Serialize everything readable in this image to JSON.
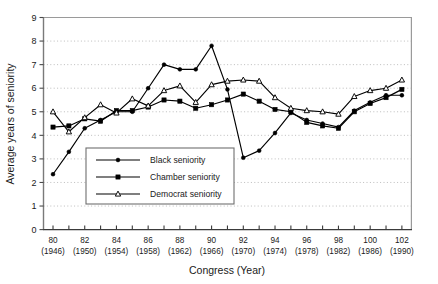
{
  "chart_data": {
    "type": "line",
    "title": "",
    "xlabel": "Congress (Year)",
    "ylabel": "Average years of seniority",
    "xlim": [
      79.4,
      102.6
    ],
    "ylim": [
      0,
      9
    ],
    "ytick_values": [
      0,
      1,
      2,
      3,
      4,
      5,
      6,
      7,
      8,
      9
    ],
    "ytick_labels": [
      "0",
      "1",
      "2",
      "3",
      "4",
      "5",
      "6",
      "7",
      "8",
      "9"
    ],
    "grid": "horizontal-dotted",
    "legend_position": "lower-left-inside",
    "x": [
      80,
      81,
      82,
      83,
      84,
      85,
      86,
      87,
      88,
      89,
      90,
      91,
      92,
      93,
      94,
      95,
      96,
      97,
      98,
      99,
      100,
      101,
      102
    ],
    "xtick_labels": [
      {
        "congress": "80",
        "year": "(1946)"
      },
      {
        "congress": "82",
        "year": "(1950)"
      },
      {
        "congress": "84",
        "year": "(1954)"
      },
      {
        "congress": "86",
        "year": "(1958)"
      },
      {
        "congress": "88",
        "year": "(1962)"
      },
      {
        "congress": "90",
        "year": "(1966)"
      },
      {
        "congress": "92",
        "year": "(1970)"
      },
      {
        "congress": "94",
        "year": "(1974)"
      },
      {
        "congress": "96",
        "year": "(1978)"
      },
      {
        "congress": "98",
        "year": "(1982)"
      },
      {
        "congress": "100",
        "year": "(1986)"
      },
      {
        "congress": "102",
        "year": "(1990)"
      }
    ],
    "series": [
      {
        "name": "Black seniority",
        "marker": "dot",
        "values": [
          2.35,
          3.3,
          4.3,
          4.65,
          5.0,
          5.0,
          6.0,
          7.0,
          6.8,
          6.8,
          7.8,
          5.95,
          3.05,
          3.35,
          4.1,
          4.95,
          4.65,
          4.5,
          4.35,
          5.05,
          5.4,
          5.7,
          5.7
        ]
      },
      {
        "name": "Chamber seniority",
        "marker": "square",
        "values": [
          4.35,
          4.4,
          4.7,
          4.6,
          5.05,
          5.05,
          5.2,
          5.5,
          5.45,
          5.15,
          5.3,
          5.5,
          5.75,
          5.45,
          5.1,
          5.0,
          4.55,
          4.4,
          4.3,
          5.0,
          5.35,
          5.6,
          5.95
        ]
      },
      {
        "name": "Democrat seniority",
        "marker": "triangle",
        "values": [
          5.0,
          4.15,
          4.75,
          5.3,
          4.95,
          5.55,
          5.25,
          5.9,
          6.1,
          5.4,
          6.15,
          6.3,
          6.35,
          6.3,
          5.6,
          5.15,
          5.05,
          5.0,
          4.9,
          5.65,
          5.9,
          6.0,
          6.35
        ]
      }
    ],
    "colors": {
      "line": "#000000",
      "axis": "#8a8a8a",
      "grid": "#b5b5b5",
      "background": "#ffffff",
      "text": "#1a1a1a"
    }
  },
  "legend": {
    "items": [
      {
        "label": "Black seniority",
        "marker": "dot"
      },
      {
        "label": "Chamber seniority",
        "marker": "square"
      },
      {
        "label": "Democrat seniority",
        "marker": "triangle"
      }
    ]
  },
  "caption": {
    "partial_text": ""
  }
}
